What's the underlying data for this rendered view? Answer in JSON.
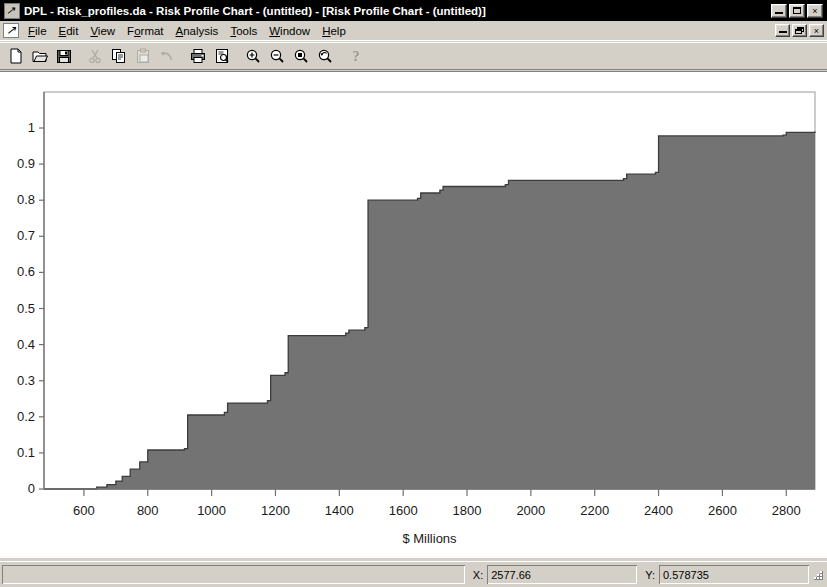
{
  "window": {
    "title": "DPL - Risk_profiles.da - Risk Profile Chart - (untitled) - [Risk Profile Chart - (untitled)]",
    "app_icon": "dpl-app-icon",
    "minimize_label": "",
    "maximize_label": "",
    "close_label": "×",
    "doc_minimize_label": "",
    "doc_restore_label": "",
    "doc_close_label": "×"
  },
  "menu": {
    "items": [
      {
        "label": "File",
        "accel": "F"
      },
      {
        "label": "Edit",
        "accel": "E"
      },
      {
        "label": "View",
        "accel": "V"
      },
      {
        "label": "Format",
        "accel": "o"
      },
      {
        "label": "Analysis",
        "accel": "A"
      },
      {
        "label": "Tools",
        "accel": "T"
      },
      {
        "label": "Window",
        "accel": "W"
      },
      {
        "label": "Help",
        "accel": "H"
      }
    ]
  },
  "toolbar": {
    "buttons": [
      {
        "name": "new-icon",
        "tip": "New",
        "enabled": true
      },
      {
        "name": "open-folder-icon",
        "tip": "Open",
        "enabled": true
      },
      {
        "name": "save-disk-icon",
        "tip": "Save",
        "enabled": true
      },
      {
        "name": "separator",
        "tip": "",
        "enabled": true
      },
      {
        "name": "cut-scissors-icon",
        "tip": "Cut",
        "enabled": false
      },
      {
        "name": "copy-icon",
        "tip": "Copy",
        "enabled": true
      },
      {
        "name": "paste-clipboard-icon",
        "tip": "Paste",
        "enabled": false
      },
      {
        "name": "undo-arrow-icon",
        "tip": "Undo",
        "enabled": false
      },
      {
        "name": "separator",
        "tip": "",
        "enabled": true
      },
      {
        "name": "print-icon",
        "tip": "Print",
        "enabled": true
      },
      {
        "name": "print-preview-icon",
        "tip": "Print Preview",
        "enabled": true
      },
      {
        "name": "separator",
        "tip": "",
        "enabled": true
      },
      {
        "name": "zoom-in-icon",
        "tip": "Zoom In",
        "enabled": true
      },
      {
        "name": "zoom-out-icon",
        "tip": "Zoom Out",
        "enabled": true
      },
      {
        "name": "zoom-window-icon",
        "tip": "Zoom Window",
        "enabled": true
      },
      {
        "name": "zoom-previous-icon",
        "tip": "Zoom Previous",
        "enabled": true
      },
      {
        "name": "separator",
        "tip": "",
        "enabled": true
      },
      {
        "name": "help-question-icon",
        "tip": "Help",
        "enabled": true
      }
    ]
  },
  "statusbar": {
    "message": "",
    "x_label": "X:",
    "x_value": "2577.66",
    "y_label": "Y:",
    "y_value": "0.578735"
  },
  "chart_data": {
    "type": "area",
    "title": "",
    "subtitle": "",
    "xlabel": "$ Millions",
    "ylabel": "",
    "xlim": [
      475,
      2890
    ],
    "ylim": [
      0,
      1.02
    ],
    "grid": false,
    "legend": null,
    "xticks": [
      600,
      800,
      1000,
      1200,
      1400,
      1600,
      1800,
      2000,
      2200,
      2400,
      2600,
      2800
    ],
    "yticks": [
      0,
      0.1,
      0.2,
      0.3,
      0.4,
      0.5,
      0.6,
      0.7,
      0.8,
      0.9,
      1
    ],
    "fill_color": "#737373",
    "line_color": "#3c3c3c",
    "axis_color": "#707070",
    "plot_bg": "#ffffff",
    "series_name": "Cumulative Probability",
    "steps": [
      {
        "x": 475,
        "y": 0.0
      },
      {
        "x": 640,
        "y": 0.005
      },
      {
        "x": 672,
        "y": 0.012
      },
      {
        "x": 700,
        "y": 0.022
      },
      {
        "x": 720,
        "y": 0.035
      },
      {
        "x": 745,
        "y": 0.055
      },
      {
        "x": 775,
        "y": 0.075
      },
      {
        "x": 800,
        "y": 0.108
      },
      {
        "x": 915,
        "y": 0.112
      },
      {
        "x": 925,
        "y": 0.205
      },
      {
        "x": 1040,
        "y": 0.212
      },
      {
        "x": 1050,
        "y": 0.238
      },
      {
        "x": 1175,
        "y": 0.245
      },
      {
        "x": 1185,
        "y": 0.315
      },
      {
        "x": 1230,
        "y": 0.322
      },
      {
        "x": 1240,
        "y": 0.425
      },
      {
        "x": 1420,
        "y": 0.432
      },
      {
        "x": 1430,
        "y": 0.44
      },
      {
        "x": 1480,
        "y": 0.447
      },
      {
        "x": 1490,
        "y": 0.8
      },
      {
        "x": 1645,
        "y": 0.805
      },
      {
        "x": 1655,
        "y": 0.82
      },
      {
        "x": 1715,
        "y": 0.828
      },
      {
        "x": 1725,
        "y": 0.838
      },
      {
        "x": 1920,
        "y": 0.843
      },
      {
        "x": 1930,
        "y": 0.855
      },
      {
        "x": 2290,
        "y": 0.86
      },
      {
        "x": 2300,
        "y": 0.872
      },
      {
        "x": 2390,
        "y": 0.877
      },
      {
        "x": 2400,
        "y": 0.978
      },
      {
        "x": 2790,
        "y": 0.98
      },
      {
        "x": 2800,
        "y": 0.988
      },
      {
        "x": 2890,
        "y": 0.99
      }
    ]
  }
}
